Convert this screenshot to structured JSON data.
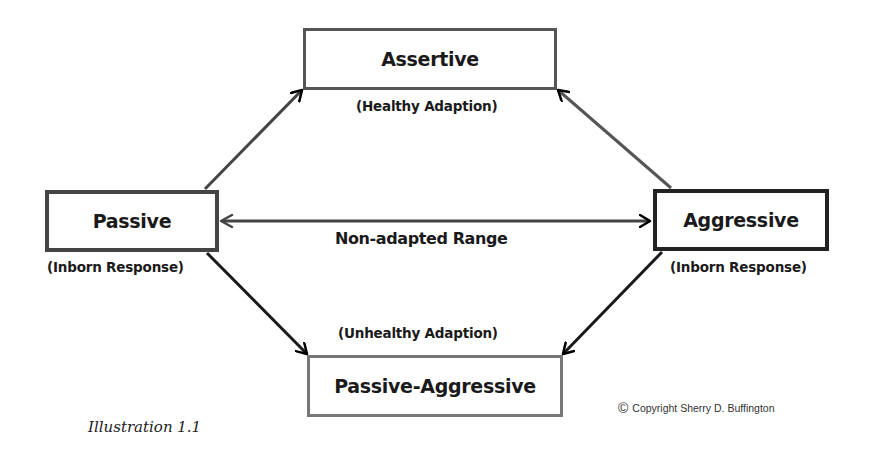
{
  "diagram": {
    "nodes": {
      "assertive": {
        "label": "Assertive",
        "sublabel": "(Healthy Adaption)"
      },
      "passive": {
        "label": "Passive",
        "sublabel": "(Inborn Response)"
      },
      "aggressive": {
        "label": "Aggressive",
        "sublabel": "(Inborn Response)"
      },
      "passive_aggressive": {
        "label": "Passive-Aggressive",
        "sublabel": "(Unhealthy Adaption)"
      }
    },
    "edges": [
      {
        "from": "Passive",
        "to": "Assertive",
        "type": "arrow"
      },
      {
        "from": "Aggressive",
        "to": "Assertive",
        "type": "arrow"
      },
      {
        "from": "Passive",
        "to": "Passive-Aggressive",
        "type": "arrow"
      },
      {
        "from": "Aggressive",
        "to": "Passive-Aggressive",
        "type": "arrow"
      },
      {
        "from": "Passive",
        "to": "Aggressive",
        "type": "double-arrow",
        "label": "Non-adapted Range"
      }
    ],
    "range_label": "Non-adapted Range",
    "caption": "Illustration 1.1",
    "copyright": {
      "icon": "copyright-icon",
      "symbol": "©",
      "text": "Copyright Sherry D. Buffington"
    }
  }
}
